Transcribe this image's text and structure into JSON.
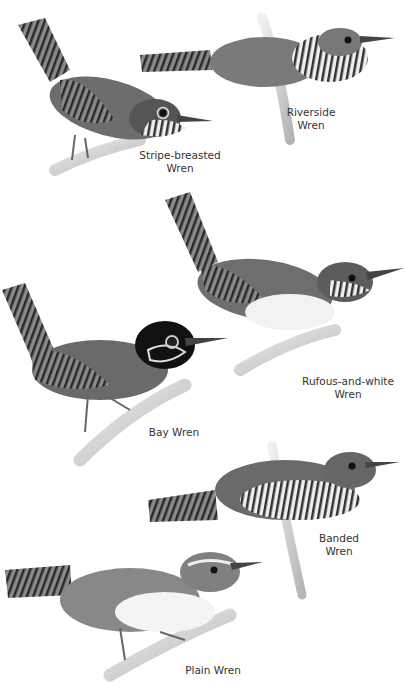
{
  "plate": {
    "birds": [
      {
        "name_line1": "Stripe-breasted",
        "name_line2": "Wren"
      },
      {
        "name_line1": "Riverside",
        "name_line2": "Wren"
      },
      {
        "name_line1": "Rufous-and-white",
        "name_line2": "Wren"
      },
      {
        "name_line1": "Bay Wren",
        "name_line2": ""
      },
      {
        "name_line1": "Banded",
        "name_line2": "Wren"
      },
      {
        "name_line1": "Plain Wren",
        "name_line2": ""
      }
    ]
  }
}
